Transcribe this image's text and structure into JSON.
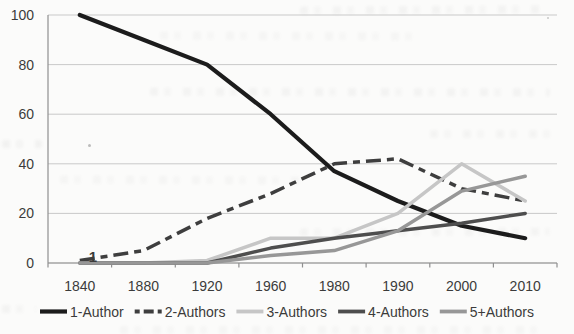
{
  "chart_data": {
    "type": "line",
    "title": "",
    "xlabel": "",
    "ylabel": "",
    "categories": [
      "1840",
      "1880",
      "1920",
      "1960",
      "1980",
      "1990",
      "2000",
      "2010"
    ],
    "series": [
      {
        "name": "1-Author",
        "color": "#1c1c1c",
        "width": 4.2,
        "dash": null,
        "values": [
          100,
          90,
          80,
          60,
          37,
          25,
          15,
          10
        ]
      },
      {
        "name": "2-Authors",
        "color": "#3e3e3e",
        "width": 3.5,
        "dash": "15 6 7 6",
        "values": [
          1,
          5,
          18,
          28,
          40,
          42,
          30,
          25
        ]
      },
      {
        "name": "3-Authors",
        "color": "#c6c6c6",
        "width": 3.5,
        "dash": null,
        "values": [
          0,
          0,
          1,
          10,
          10,
          20,
          40,
          25
        ]
      },
      {
        "name": "4-Authors",
        "color": "#4e4e4e",
        "width": 3.5,
        "dash": null,
        "values": [
          0,
          0,
          0,
          6,
          10,
          13,
          16,
          20
        ]
      },
      {
        "name": "5+Authors",
        "color": "#979797",
        "width": 3.5,
        "dash": null,
        "values": [
          0,
          0,
          0,
          3,
          5,
          13,
          29,
          35
        ]
      }
    ],
    "y_ticks": [
      0,
      20,
      40,
      60,
      80,
      100
    ],
    "ylim": [
      0,
      100
    ],
    "grid": true,
    "legend_position": "bottom",
    "annotations": [
      {
        "text": "1",
        "x": 93,
        "y": 262
      }
    ]
  },
  "colors": {
    "grid": "#c9c9c9",
    "axis": "#8f8f8f",
    "tick_text": "#3b3b3b",
    "legend_text": "#2f2f2f",
    "background": "#fbfbfa"
  }
}
